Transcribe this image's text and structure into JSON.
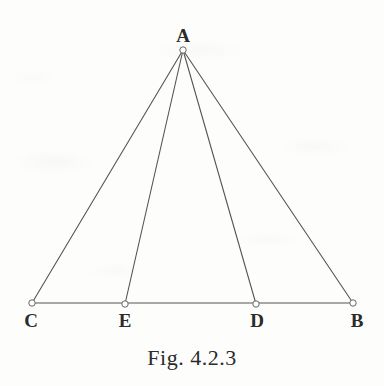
{
  "figure": {
    "caption": "Fig. 4.2.3",
    "canvas": {
      "width": 384,
      "height": 386
    },
    "colors": {
      "stroke": "#555555",
      "vertex_fill": "#ffffff",
      "vertex_stroke": "#666666",
      "text": "#2b2b2b",
      "background": "#fdfdfc"
    },
    "points": [
      {
        "id": "A",
        "label": "A",
        "x": 183,
        "y": 50,
        "label_x": 183,
        "label_y": 26,
        "label_pos": "above"
      },
      {
        "id": "C",
        "label": "C",
        "x": 32,
        "y": 303,
        "label_x": 31,
        "label_y": 311,
        "label_pos": "below"
      },
      {
        "id": "E",
        "label": "E",
        "x": 125,
        "y": 304,
        "label_x": 125,
        "label_y": 311,
        "label_pos": "below"
      },
      {
        "id": "D",
        "label": "D",
        "x": 256,
        "y": 304,
        "label_x": 257,
        "label_y": 311,
        "label_pos": "below"
      },
      {
        "id": "B",
        "label": "B",
        "x": 353,
        "y": 303,
        "label_x": 357,
        "label_y": 311,
        "label_pos": "below"
      }
    ],
    "segments": [
      {
        "id": "AC",
        "from": "A",
        "to": "C"
      },
      {
        "id": "AE",
        "from": "A",
        "to": "E"
      },
      {
        "id": "AD",
        "from": "A",
        "to": "D"
      },
      {
        "id": "AB",
        "from": "A",
        "to": "B"
      },
      {
        "id": "CB",
        "from": "C",
        "to": "B"
      }
    ],
    "vertex_radius": 3.2,
    "stroke_width": 1.1
  }
}
